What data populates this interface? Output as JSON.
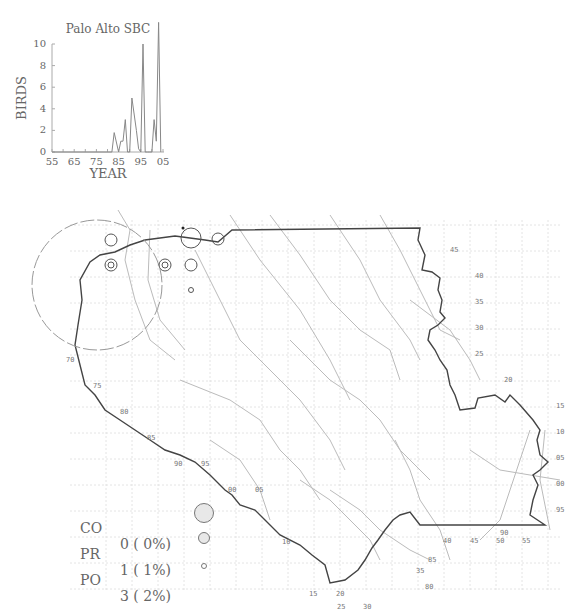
{
  "chart_data": {
    "type": "line",
    "title": "Palo Alto SBC",
    "xlabel": "YEAR",
    "ylabel": "BIRDS",
    "xlim": [
      1955,
      2005
    ],
    "ylim": [
      0,
      12
    ],
    "x_ticks": [
      "55",
      "65",
      "75",
      "85",
      "95",
      "05"
    ],
    "y_ticks": [
      "0",
      "2",
      "4",
      "6",
      "8",
      "10"
    ],
    "grid": false,
    "series": [
      {
        "name": "Palo Alto SBC",
        "x": [
          1955,
          1982,
          1983,
          1985,
          1986,
          1987,
          1988,
          1989,
          1990,
          1991,
          1993,
          1994,
          1995,
          1996,
          1997,
          1998,
          1999,
          2000,
          2001,
          2002,
          2003,
          2004
        ],
        "values": [
          0,
          0,
          1.8,
          0,
          1,
          1,
          3,
          0,
          0,
          5,
          2,
          0.3,
          0,
          10,
          0,
          0,
          0,
          0,
          3,
          1,
          12,
          0
        ]
      }
    ]
  },
  "map": {
    "grid_labels_left": [
      "70",
      "75",
      "80",
      "85",
      "90",
      "95",
      "00",
      "05",
      "10",
      "15",
      "20",
      "25",
      "30"
    ],
    "grid_labels_right": [
      "45",
      "40",
      "35",
      "30",
      "25",
      "20",
      "15",
      "10",
      "05",
      "00",
      "95"
    ],
    "grid_labels_bottom": [
      "35",
      "40",
      "45",
      "50",
      "55"
    ],
    "grid_labels_extra": [
      "85",
      "80",
      "90"
    ]
  },
  "legend": {
    "rows": [
      {
        "code": "CO",
        "value": "0 ( 0%)"
      },
      {
        "code": "PR",
        "value": "1 ( 1%)"
      },
      {
        "code": "PO",
        "value": "3 ( 2%)"
      }
    ]
  }
}
